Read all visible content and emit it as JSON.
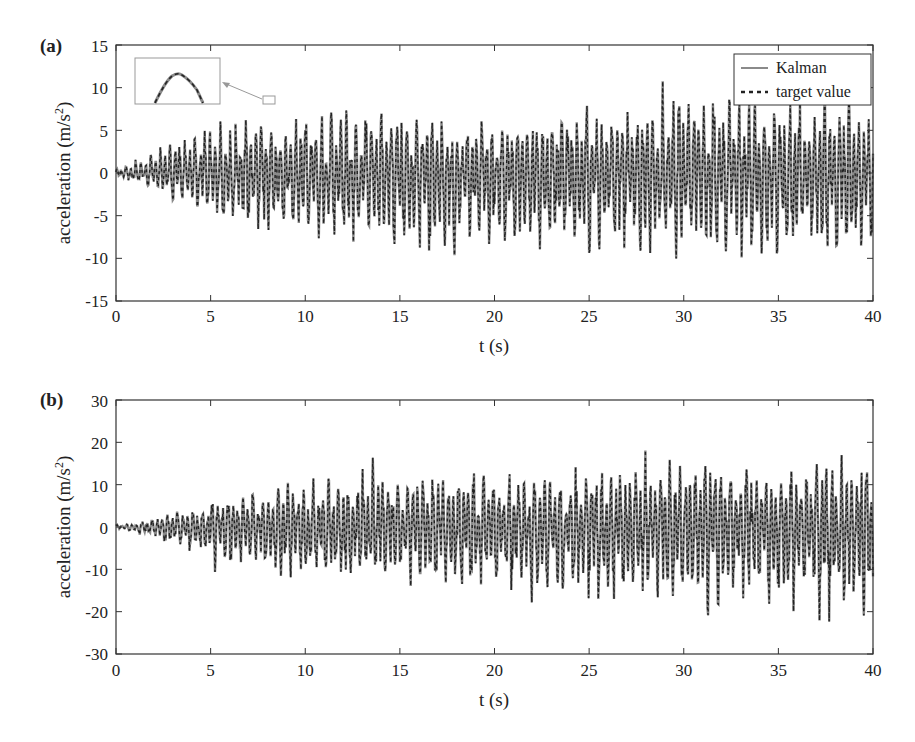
{
  "chart_data": [
    {
      "panel_label": "(a)",
      "type": "line",
      "title": "",
      "xlabel": "t (s)",
      "ylabel": "acceleration (m/s²)",
      "xlim": [
        0,
        40
      ],
      "ylim": [
        -15,
        15
      ],
      "xticks": [
        0,
        5,
        10,
        15,
        20,
        25,
        30,
        35,
        40
      ],
      "yticks": [
        -15,
        -10,
        -5,
        0,
        5,
        10,
        15
      ],
      "legend": {
        "position": "upper right",
        "entries": [
          "Kalman",
          "target value"
        ]
      },
      "grid": false,
      "series": [
        {
          "name": "Kalman",
          "style": "solid",
          "color": "#8a8a8a",
          "description": "Dense oscillating acceleration record; near zero until ~2 s, amplitude grows to about ±5–11 m/s²",
          "approx_envelope": {
            "t": [
              0,
              2,
              5,
              10,
              15,
              20,
              25,
              30,
              35,
              40
            ],
            "max": [
              0.5,
              3,
              6,
              8,
              8,
              7,
              9,
              11,
              10,
              10
            ],
            "min": [
              -0.5,
              -2,
              -7,
              -9,
              -10,
              -11,
              -11,
              -11,
              -12,
              -12
            ]
          }
        },
        {
          "name": "target value",
          "style": "dashed",
          "color": "#222222",
          "description": "Overlaps Kalman estimate almost exactly"
        }
      ],
      "annotations": [
        {
          "type": "inset-zoom",
          "at_t": 8.2,
          "at_value": 8.5,
          "description": "Zoomed inset of a peak showing the Kalman and target curves overlapping"
        }
      ]
    },
    {
      "panel_label": "(b)",
      "type": "line",
      "title": "",
      "xlabel": "t (s)",
      "ylabel": "acceleration (m/s²)",
      "xlim": [
        0,
        40
      ],
      "ylim": [
        -30,
        30
      ],
      "xticks": [
        0,
        5,
        10,
        15,
        20,
        25,
        30,
        35,
        40
      ],
      "yticks": [
        -30,
        -20,
        -10,
        0,
        10,
        20,
        30
      ],
      "grid": false,
      "series": [
        {
          "name": "Kalman",
          "style": "solid",
          "color": "#8a8a8a",
          "description": "Dense oscillating acceleration record; amplitude grows to about ±15–24 m/s²",
          "approx_envelope": {
            "t": [
              0,
              2,
              5,
              10,
              15,
              20,
              25,
              30,
              35,
              40
            ],
            "max": [
              0.5,
              2,
              8,
              12,
              16,
              14,
              15,
              19,
              17,
              19
            ],
            "min": [
              -0.5,
              -3,
              -10,
              -15,
              -15,
              -19,
              -19,
              -21,
              -20,
              -24
            ]
          }
        },
        {
          "name": "target value",
          "style": "dashed",
          "color": "#222222",
          "description": "Overlaps Kalman estimate almost exactly"
        }
      ]
    }
  ],
  "panels": {
    "a": {
      "label": "(a)",
      "ylabel_main": "acceleration (m/s",
      "ylabel_sup": "2",
      "ylabel_close": ")",
      "xlabel": "t (s)",
      "yticks": [
        "15",
        "10",
        "5",
        "0",
        "-5",
        "-10",
        "-15"
      ],
      "xticks": [
        "0",
        "5",
        "10",
        "15",
        "20",
        "25",
        "30",
        "35",
        "40"
      ],
      "legend": {
        "kalman": "Kalman",
        "target": "target value"
      }
    },
    "b": {
      "label": "(b)",
      "ylabel_main": "acceleration (m/s",
      "ylabel_sup": "2",
      "ylabel_close": ")",
      "xlabel": "t (s)",
      "yticks": [
        "30",
        "20",
        "10",
        "0",
        "-10",
        "-20",
        "-30"
      ],
      "xticks": [
        "0",
        "5",
        "10",
        "15",
        "20",
        "25",
        "30",
        "35",
        "40"
      ]
    }
  },
  "colors": {
    "kalman": "#8a8a8a",
    "target": "#222222",
    "axis": "#333333",
    "inset_box": "#999999"
  }
}
